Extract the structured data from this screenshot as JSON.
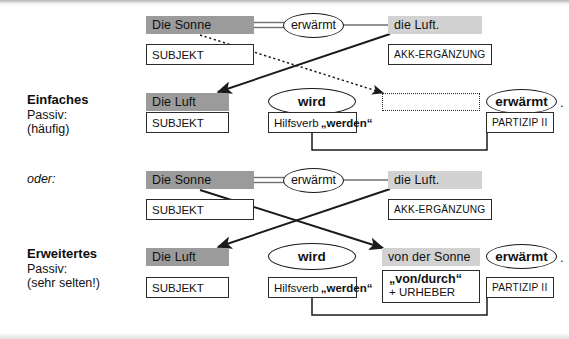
{
  "diagram": {
    "colors": {
      "chip_dark": "#9b9b9b",
      "chip_light": "#d2d2d2",
      "line": "#1a1a1a",
      "background": "#ffffff"
    }
  },
  "sections": [
    {
      "id": "einfaches",
      "caption_title": "Einfaches",
      "caption_line2": "Passiv:",
      "caption_line3": "(häufig)",
      "active_row": {
        "subject_word": "Die Sonne",
        "subject_label": "SUBJEKT",
        "verb_word": "erwärmt",
        "object_word": "die Luft.",
        "object_label": "AKK-ERGÄNZUNG"
      },
      "passive_row": {
        "subject_word": "Die Luft",
        "subject_label": "SUBJEKT",
        "aux_word": "wird",
        "aux_label_plain": "Hilfsverb",
        "aux_label_bold": "„werden“",
        "agent_word": "",
        "agent_label": "",
        "participle_word": "erwärmt",
        "participle_period": ".",
        "participle_label": "PARTIZIP II"
      }
    },
    {
      "id": "erweitertes",
      "caption_or": "oder:",
      "caption_title": "Erweitertes",
      "caption_line2": "Passiv:",
      "caption_line3": "(sehr selten!)",
      "active_row": {
        "subject_word": "Die Sonne",
        "subject_label": "SUBJEKT",
        "verb_word": "erwärmt",
        "object_word": "die Luft.",
        "object_label": "AKK-ERGÄNZUNG"
      },
      "passive_row": {
        "subject_word": "Die Luft",
        "subject_label": "SUBJEKT",
        "aux_word": "wird",
        "aux_label_plain": "Hilfsverb",
        "aux_label_bold": "„werden“",
        "agent_word": "von der Sonne",
        "agent_label_bold": "„von/durch“",
        "agent_label_plain": "+ URHEBER",
        "participle_word": "erwärmt",
        "participle_period": ".",
        "participle_label": "PARTIZIP II"
      }
    }
  ]
}
